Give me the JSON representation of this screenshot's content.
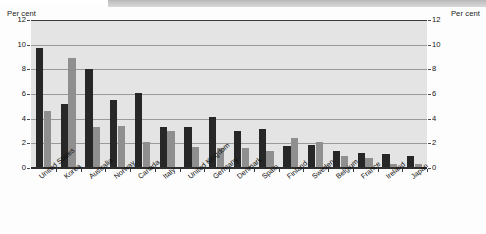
{
  "axis_caption_left": "Per cent",
  "axis_caption_right": "Per cent",
  "yticks": [
    "12",
    "10",
    "8",
    "6",
    "4",
    "2",
    "0"
  ],
  "colors": {
    "series_1": "#272727",
    "series_2": "#8f8f8f",
    "plot_background": "#e4e4e4",
    "gridline": "#9a9a9a",
    "axis": "#2e2e2e"
  },
  "chart_data": {
    "type": "bar",
    "title": "",
    "subtitle": "",
    "xlabel": "",
    "ylabel": "Per cent",
    "ylim": [
      0,
      12
    ],
    "ytick_step": 2,
    "grid": true,
    "legend": "none",
    "dual_axis": true,
    "right_ylabel": "Per cent",
    "categories": [
      "United States",
      "Korea",
      "Australia",
      "Norway",
      "Canada",
      "Italy",
      "United Kingdom",
      "Germany",
      "Denmark",
      "Spain",
      "Finland",
      "Sweden",
      "Belgium",
      "France",
      "Ireland",
      "Japan"
    ],
    "series": [
      {
        "name": "series-1",
        "color": "#272727",
        "values": [
          9.7,
          5.2,
          8.0,
          5.5,
          6.1,
          3.3,
          3.3,
          4.1,
          3.0,
          3.2,
          1.8,
          1.9,
          1.4,
          1.2,
          1.1,
          0.95
        ]
      },
      {
        "name": "series-2",
        "color": "#8f8f8f",
        "values": [
          4.6,
          8.9,
          3.3,
          3.4,
          2.1,
          3.0,
          1.7,
          1.6,
          1.6,
          1.4,
          2.4,
          2.1,
          0.95,
          0.85,
          0.35,
          0.3
        ]
      }
    ]
  }
}
